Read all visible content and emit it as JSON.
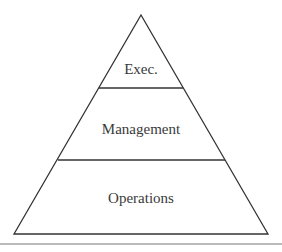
{
  "diagram": {
    "type": "pyramid",
    "levels": [
      {
        "label": "Exec."
      },
      {
        "label": "Management"
      },
      {
        "label": "Operations"
      }
    ],
    "colors": {
      "stroke": "#333333",
      "text": "#3a3a3a",
      "background": "#ffffff",
      "rule": "#555555"
    }
  }
}
